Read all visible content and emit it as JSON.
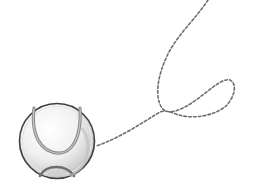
{
  "illustration": {
    "subject": "tennis ball with dashed motion trajectory",
    "colors": {
      "background": "#ffffff",
      "ball_outline": "#4a4a4a",
      "ball_fill_light": "#ffffff",
      "ball_fill_shade": "#c8c8c8",
      "seam": "#7a7a7a",
      "trajectory": "#6e6e6e"
    },
    "ball": {
      "cx": 57,
      "cy": 141,
      "r": 38
    },
    "trajectory_path": "M 208 0 C 196 18, 168 42, 162 70 C 156 96, 158 116, 172 112 C 192 106, 212 90, 224 82 C 236 76, 236 96, 228 104 C 218 114, 190 118, 176 112 C 156 124, 130 138, 97 146"
  }
}
